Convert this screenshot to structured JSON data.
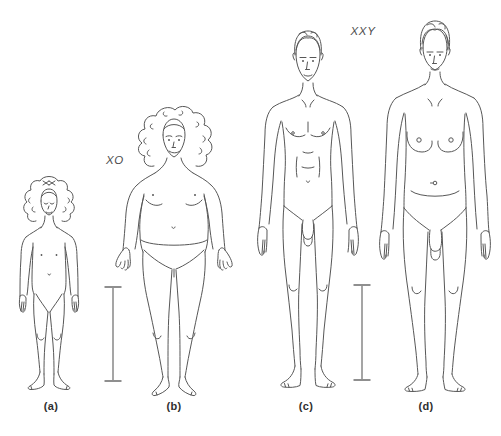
{
  "illustration_title": "comparative karyotype phenotype line drawing",
  "panels": [
    {
      "id": "a",
      "label": "(a)",
      "karyotype": null
    },
    {
      "id": "b",
      "label": "(b)",
      "karyotype": "XO"
    },
    {
      "id": "c",
      "label": "(c)",
      "karyotype": null
    },
    {
      "id": "d",
      "label": "(d)",
      "karyotype": "XXY"
    }
  ],
  "colors": {
    "line": "#575757",
    "label": "#2f2f2f",
    "karyo": "#4d4d4d",
    "bar": "#8f8f8f",
    "bg": "#ffffff"
  }
}
